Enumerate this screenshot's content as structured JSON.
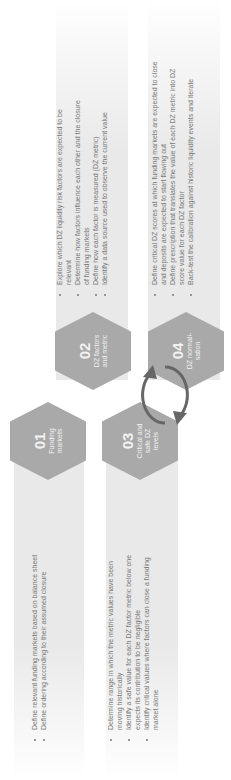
{
  "steps": [
    {
      "num": "01",
      "label": "Funding markets",
      "bullets": [
        "Define relevant funding markets based on balance sheet",
        "Define ordering according to their assumed closure"
      ]
    },
    {
      "num": "02",
      "label": "DZ factors and metric",
      "bullets": [
        "Explore which DZ liquidity risk factors are expected to be relevant",
        "Determine how factors influence each other and the closure of funding markets",
        "Define how each factor is measured (DZ metric)",
        "Identify a data source used to observe the current value"
      ]
    },
    {
      "num": "03",
      "label": "Critical and safe DZ levels",
      "bullets": [
        "Determine range in which the metric values have been moving historically",
        "Identify a safe value for each DZ factor metric below one expects its contribution to be negligible",
        "Identify critical values where factors can close a funding market alone"
      ]
    },
    {
      "num": "04",
      "label": "DZ normali-sation",
      "bullets": [
        "Define critical DZ scores at which funding markets are expected to close and deposits are expected to start flowing out",
        "Define prescription that translates the value of each DZ metric into DZ score value for each DZ factor",
        "Back-test the calibration against historic liquidity events and iterate"
      ]
    }
  ],
  "colors": {
    "hex": "#a9a9a9",
    "band": "#e9e9e9",
    "text": "#777777",
    "arrow": "#666666"
  }
}
